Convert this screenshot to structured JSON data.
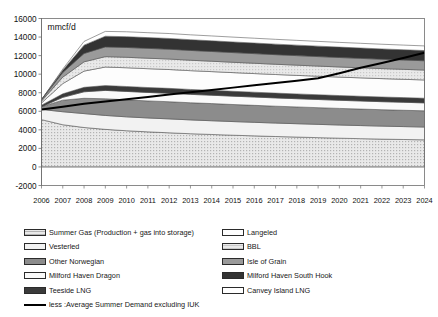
{
  "chart_data": {
    "type": "area",
    "title": "",
    "subtitle": "",
    "unit_label": "mmcf/d",
    "xlabel": "",
    "ylabel": "",
    "stacked": true,
    "grid": false,
    "legend_position": "bottom",
    "ylim": [
      -2000,
      16000
    ],
    "ytick_step": 2000,
    "yticks": [
      "16000",
      "14000",
      "12000",
      "10000",
      "8000",
      "6000",
      "4000",
      "2000",
      "0",
      "-2000"
    ],
    "categories": [
      "2006",
      "2007",
      "2008",
      "2009",
      "2010",
      "2011",
      "2012",
      "2013",
      "2014",
      "2015",
      "2016",
      "2017",
      "2018",
      "2019",
      "2020",
      "2021",
      "2022",
      "2023",
      "2024"
    ],
    "series": [
      {
        "name": "Summer Gas (Production + gas into storage)",
        "color": "#b3b3b3",
        "pattern": "fine-dots",
        "values": [
          5100,
          4550,
          4250,
          4050,
          3900,
          3780,
          3680,
          3580,
          3500,
          3420,
          3350,
          3280,
          3220,
          3160,
          3100,
          3050,
          3000,
          2960,
          2920
        ]
      },
      {
        "name": "Vesterled",
        "color": "#f2f2f2",
        "pattern": "solid",
        "values": [
          1100,
          1400,
          1500,
          1500,
          1500,
          1500,
          1500,
          1490,
          1480,
          1470,
          1460,
          1450,
          1440,
          1430,
          1420,
          1410,
          1400,
          1390,
          1380
        ]
      },
      {
        "name": "Other Norwegian",
        "color": "#8c8c8c",
        "pattern": "solid",
        "values": [
          300,
          1250,
          1650,
          1800,
          1830,
          1840,
          1850,
          1850,
          1850,
          1840,
          1830,
          1820,
          1810,
          1800,
          1790,
          1780,
          1770,
          1760,
          1750
        ]
      },
      {
        "name": "Milford Haven Dragon",
        "color": "#fafafa",
        "pattern": "solid",
        "values": [
          0,
          300,
          700,
          900,
          910,
          910,
          910,
          905,
          900,
          900,
          895,
          890,
          885,
          880,
          875,
          870,
          865,
          860,
          855
        ]
      },
      {
        "name": "Teeside LNG",
        "color": "#3a3a3a",
        "pattern": "solid",
        "values": [
          150,
          380,
          480,
          520,
          530,
          530,
          530,
          528,
          525,
          522,
          520,
          518,
          515,
          512,
          510,
          508,
          505,
          502,
          500
        ]
      },
      {
        "name": "Langeled",
        "color": "#fdfdfd",
        "pattern": "solid",
        "values": [
          250,
          1100,
          1750,
          2000,
          2020,
          2030,
          2030,
          2025,
          2020,
          2015,
          2010,
          2005,
          2000,
          1995,
          1990,
          1985,
          1980,
          1975,
          1970
        ]
      },
      {
        "name": "BBL",
        "color": "#c9c9c9",
        "pattern": "fine-dots",
        "values": [
          200,
          700,
          1000,
          1120,
          1130,
          1130,
          1130,
          1125,
          1120,
          1115,
          1110,
          1105,
          1100,
          1095,
          1090,
          1085,
          1080,
          1075,
          1070
        ]
      },
      {
        "name": "Isle of Grain",
        "color": "#9a9a9a",
        "pattern": "solid",
        "values": [
          150,
          500,
          900,
          1050,
          1060,
          1060,
          1060,
          1055,
          1050,
          1045,
          1040,
          1035,
          1030,
          1025,
          1020,
          1015,
          1010,
          1005,
          1000
        ]
      },
      {
        "name": "Milford Haven South Hook",
        "color": "#333333",
        "pattern": "solid",
        "values": [
          0,
          250,
          900,
          1150,
          1160,
          1160,
          1160,
          1155,
          1150,
          1145,
          1140,
          1135,
          1130,
          1125,
          1120,
          1115,
          1110,
          1105,
          1100
        ]
      },
      {
        "name": "Canvey Island LNG",
        "color": "#ffffff",
        "pattern": "solid",
        "values": [
          0,
          120,
          400,
          520,
          530,
          530,
          530,
          528,
          525,
          522,
          520,
          518,
          515,
          512,
          510,
          508,
          505,
          502,
          500
        ]
      }
    ],
    "line_series": {
      "name": "less :Average Summer Demand excluding IUK",
      "color": "#000000",
      "values": [
        6200,
        6500,
        6800,
        7050,
        7300,
        7550,
        7800,
        8050,
        8300,
        8550,
        8800,
        9050,
        9300,
        9550,
        10100,
        10700,
        11200,
        11750,
        12300
      ]
    }
  },
  "legend": {
    "left_column": [
      {
        "label": "Summer Gas (Production + gas into storage)"
      },
      {
        "label": "Vesterled"
      },
      {
        "label": "Other Norwegian"
      },
      {
        "label": "Milford Haven Dragon"
      },
      {
        "label": "Teeside LNG"
      },
      {
        "label": "less :Average Summer Demand excluding IUK"
      }
    ],
    "right_column": [
      {
        "label": "Langeled"
      },
      {
        "label": "BBL"
      },
      {
        "label": "Isle of Grain"
      },
      {
        "label": "Milford Haven South Hook"
      },
      {
        "label": "Canvey Island LNG"
      }
    ]
  }
}
